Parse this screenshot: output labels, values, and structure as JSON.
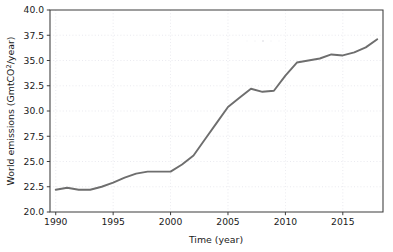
{
  "chart_data": {
    "type": "line",
    "title": "",
    "xlabel": "Time (year)",
    "ylabel": "World emissions (GmtCO",
    "ylabel_superscript": "2",
    "ylabel_suffix": "/year)",
    "ylabel_full": "World emissions (GmtCO2/year)",
    "xlim": [
      1989.5,
      2018.5
    ],
    "ylim": [
      20.0,
      40.0
    ],
    "grid": true,
    "legend": "none",
    "line_color": "#6e6e6e",
    "background_color": "#ffffff",
    "axis_color": "#3c3c3c",
    "grid_color": "#d8d8e2",
    "xticks": [
      1990,
      1995,
      2000,
      2005,
      2010,
      2015
    ],
    "xtick_labels": [
      "1990",
      "1995",
      "2000",
      "2005",
      "2010",
      "2015"
    ],
    "yticks": [
      20.0,
      22.5,
      25.0,
      27.5,
      30.0,
      32.5,
      35.0,
      37.5,
      40.0
    ],
    "ytick_labels": [
      "20.0",
      "22.5",
      "25.0",
      "27.5",
      "30.0",
      "32.5",
      "35.0",
      "37.5",
      "40.0"
    ],
    "series": [
      {
        "name": "World emissions",
        "x": [
          1990,
          1991,
          1992,
          1993,
          1994,
          1995,
          1996,
          1997,
          1998,
          1999,
          2000,
          2001,
          2002,
          2003,
          2004,
          2005,
          2006,
          2007,
          2008,
          2009,
          2010,
          2011,
          2012,
          2013,
          2014,
          2015,
          2016,
          2017,
          2018
        ],
        "values": [
          22.2,
          22.4,
          22.2,
          22.2,
          22.5,
          22.9,
          23.4,
          23.8,
          24.0,
          24.0,
          24.0,
          24.7,
          25.6,
          27.2,
          28.8,
          30.4,
          31.3,
          32.2,
          31.9,
          32.0,
          33.5,
          34.8,
          35.0,
          35.2,
          35.6,
          35.5,
          35.8,
          36.3,
          37.1
        ]
      }
    ]
  }
}
